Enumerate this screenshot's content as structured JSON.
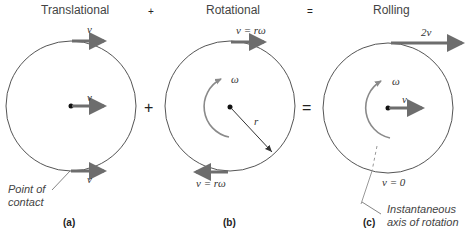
{
  "panels": {
    "a": {
      "title": "Translational",
      "top_velocity": "v",
      "center_velocity": "v",
      "bottom_velocity": "v",
      "annotation_line1": "Point of",
      "annotation_line2": "contact",
      "caption": "(a)"
    },
    "b": {
      "title": "Rotational",
      "top_velocity": "v = rω",
      "angular_velocity": "ω",
      "radius": "r",
      "bottom_velocity": "v = rω",
      "caption": "(b)"
    },
    "c": {
      "title": "Rolling",
      "top_velocity": "2v",
      "angular_velocity": "ω",
      "center_velocity": "v",
      "contact_velocity": "v = 0",
      "annotation_line1": "Instantaneous",
      "annotation_line2": "axis of rotation",
      "caption": "(c)"
    }
  },
  "operators": {
    "plus_top": "+",
    "equals_top": "=",
    "plus_mid": "+",
    "equals_mid": "="
  },
  "colors": {
    "arrow": "#6d6d6d",
    "circle": "#555555",
    "arc": "#8a8a8a"
  }
}
